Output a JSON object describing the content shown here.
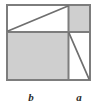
{
  "figure": {
    "kind": "geometric-dissection-diagram",
    "colors": {
      "background": "#ffffff",
      "stroke": "#7d7d7d",
      "shade_fill": "#cfcfcf",
      "white_fill": "#ffffff",
      "label_color": "#2b2b2b"
    },
    "stroke_width": 2,
    "outer_square": {
      "name": "outer-square",
      "x": 7,
      "y": 5,
      "width": 83,
      "height": 75
    },
    "dividers": {
      "horizontal_y": 32,
      "vertical_x": 68.5
    },
    "regions": [
      {
        "name": "top-left-rectangle",
        "fill": "white",
        "x": 7,
        "y": 5,
        "width": 61.5,
        "height": 27
      },
      {
        "name": "top-right-square-a",
        "fill": "gray",
        "x": 68.5,
        "y": 5,
        "width": 21.5,
        "height": 27
      },
      {
        "name": "bottom-left-square-b",
        "fill": "gray",
        "x": 7,
        "y": 32,
        "width": 61.5,
        "height": 48
      },
      {
        "name": "bottom-right-rectangle",
        "fill": "white",
        "x": 68.5,
        "y": 32,
        "width": 21.5,
        "height": 48
      }
    ],
    "diagonals": [
      {
        "name": "upper-diagonal",
        "x1": 8,
        "y1": 31,
        "x2": 68,
        "y2": 6
      },
      {
        "name": "lower-diagonal",
        "x1": 69,
        "y1": 33,
        "x2": 89,
        "y2": 79
      }
    ],
    "labels": [
      {
        "name": "label-b",
        "text": "b",
        "x": 31,
        "y": 101
      },
      {
        "name": "label-a",
        "text": "a",
        "x": 79,
        "y": 101
      }
    ]
  }
}
